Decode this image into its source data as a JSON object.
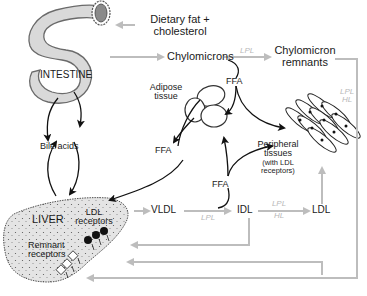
{
  "colors": {
    "organ_fill": "#d9d9d9",
    "organ_stroke": "#6a6a6a",
    "pathway_gray": "#bdbdbd",
    "black_arrow": "#111111",
    "enzyme_label": "#b8b8b8"
  },
  "organs": {
    "intestine": "INTESTINE",
    "liver": "LIVER",
    "adipose_line1": "Adipose",
    "adipose_line2": "tissue",
    "peripheral_line1": "Peripheral",
    "peripheral_line2": "tissues",
    "peripheral_line3": "(with LDL",
    "peripheral_line4": "receptors)"
  },
  "inputs": {
    "dietary_line1": "Dietary fat +",
    "dietary_line2": "cholesterol"
  },
  "lipoproteins": {
    "chylomicrons": "Chylomicrons",
    "remnants_line1": "Chylomicron",
    "remnants_line2": "remnants",
    "vldl": "VLDL",
    "idl": "IDL",
    "ldl": "LDL"
  },
  "metabolites": {
    "ffa_top": "FFA",
    "ffa_adipose": "FFA",
    "ffa_vldl": "FFA",
    "bile_acids": "Bile acids"
  },
  "receptors": {
    "ldl_line1": "LDL",
    "ldl_line2": "receptors",
    "remnant_line1": "Remnant",
    "remnant_line2": "receptors"
  },
  "enzymes": {
    "chylo_lpl": "LPL",
    "remnant_lpl": "LPL",
    "remnant_hl": "HL",
    "vldl_lpl": "LPL",
    "idl_lpl": "LPL",
    "idl_hl": "HL"
  }
}
